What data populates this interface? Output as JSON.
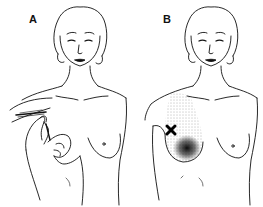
{
  "figure": {
    "panels": [
      {
        "id": "A",
        "label": "A",
        "depicts": "needle insertion at anterior shoulder/axilla with two hands"
      },
      {
        "id": "B",
        "label": "B",
        "depicts": "stippled referred pain pattern over chest and breast with X marking trigger point"
      }
    ],
    "colors": {
      "line": "#111111",
      "background": "#ffffff",
      "stipple": "#1a1a1a"
    },
    "marker": "X"
  }
}
